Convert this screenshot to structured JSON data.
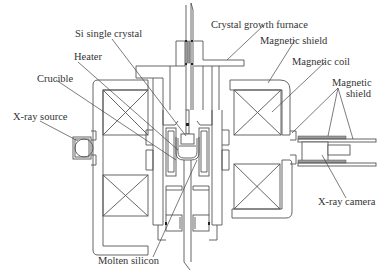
{
  "figure": {
    "type": "schematic"
  },
  "labels": {
    "si_single_crystal": "Si single crystal",
    "crystal_growth_furnace": "Crystal growth furnace",
    "heater": "Heater",
    "magnetic_shield_top": "Magnetic shield",
    "magnetic_coil": "Magnetic coil",
    "crucible": "Crucible",
    "magnetic_shield_right_line1": "Magnetic",
    "magnetic_shield_right_line2": "shield",
    "xray_source": "X-ray source",
    "xray_camera": "X-ray camera",
    "molten_silicon": "Molten silicon"
  },
  "colors": {
    "line": "#555555",
    "text": "#333333",
    "shield_fill": "#9a9a9a",
    "background": "#ffffff"
  }
}
